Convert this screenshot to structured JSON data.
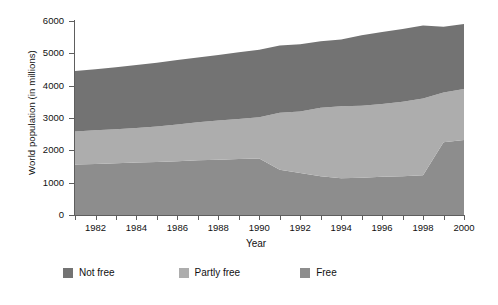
{
  "chart_data": {
    "type": "area",
    "stacked": true,
    "title": "",
    "xlabel": "Year",
    "ylabel": "World population (in millions)",
    "x": [
      1981,
      1982,
      1983,
      1984,
      1985,
      1986,
      1987,
      1988,
      1989,
      1990,
      1991,
      1992,
      1993,
      1994,
      1995,
      1996,
      1997,
      1998,
      1999,
      2000
    ],
    "xlim": [
      1981,
      2000
    ],
    "ylim": [
      0,
      6000
    ],
    "yticks": [
      0,
      1000,
      2000,
      3000,
      4000,
      5000,
      6000
    ],
    "xticks": [
      1982,
      1984,
      1986,
      1988,
      1990,
      1992,
      1994,
      1996,
      1998,
      2000
    ],
    "xtick_all_years": [
      1981,
      1982,
      1983,
      1984,
      1985,
      1986,
      1987,
      1988,
      1989,
      1990,
      1991,
      1992,
      1993,
      1994,
      1995,
      1996,
      1997,
      1998,
      1999,
      2000
    ],
    "grid": false,
    "legend_position": "below",
    "series": [
      {
        "name": "Free",
        "color": "#8d8d8d",
        "stack_order": 1,
        "values": [
          1560,
          1580,
          1600,
          1620,
          1640,
          1660,
          1690,
          1710,
          1730,
          1750,
          1400,
          1300,
          1200,
          1140,
          1150,
          1180,
          1200,
          1230,
          2250,
          2320
        ]
      },
      {
        "name": "Partly free",
        "color": "#adadad",
        "stack_order": 2,
        "values": [
          1020,
          1040,
          1050,
          1070,
          1100,
          1140,
          1180,
          1210,
          1240,
          1270,
          1760,
          1900,
          2120,
          2220,
          2230,
          2250,
          2300,
          2370,
          1540,
          1580
        ]
      },
      {
        "name": "Not free",
        "color": "#737373",
        "stack_order": 3,
        "values": [
          1870,
          1890,
          1920,
          1950,
          1970,
          1990,
          2000,
          2030,
          2060,
          2090,
          2080,
          2080,
          2050,
          2070,
          2180,
          2230,
          2250,
          2260,
          2030,
          2010
        ]
      }
    ],
    "totals": [
      4450,
      4510,
      4570,
      4640,
      4710,
      4790,
      4870,
      4950,
      5030,
      5110,
      5240,
      5280,
      5370,
      5430,
      5560,
      5660,
      5750,
      5860,
      5820,
      5910
    ]
  },
  "legend": {
    "items": [
      {
        "label": "Not free",
        "color": "#737373"
      },
      {
        "label": "Partly free",
        "color": "#adadad"
      },
      {
        "label": "Free",
        "color": "#8d8d8d"
      }
    ]
  },
  "axes": {
    "y_title": "World population (in millions)",
    "x_title": "Year",
    "y_tick_labels": [
      "0",
      "1000",
      "2000",
      "3000",
      "4000",
      "5000",
      "6000"
    ],
    "x_tick_labels": [
      "1982",
      "1984",
      "1986",
      "1988",
      "1990",
      "1992",
      "1994",
      "1996",
      "1998",
      "2000"
    ]
  }
}
